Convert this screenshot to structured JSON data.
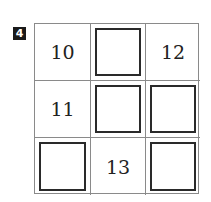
{
  "problem": {
    "number": "4",
    "grid": [
      [
        {
          "type": "number",
          "value": "10"
        },
        {
          "type": "blank"
        },
        {
          "type": "number",
          "value": "12"
        }
      ],
      [
        {
          "type": "number",
          "value": "11"
        },
        {
          "type": "blank"
        },
        {
          "type": "blank"
        }
      ],
      [
        {
          "type": "blank"
        },
        {
          "type": "number",
          "value": "13"
        },
        {
          "type": "blank"
        }
      ]
    ]
  }
}
